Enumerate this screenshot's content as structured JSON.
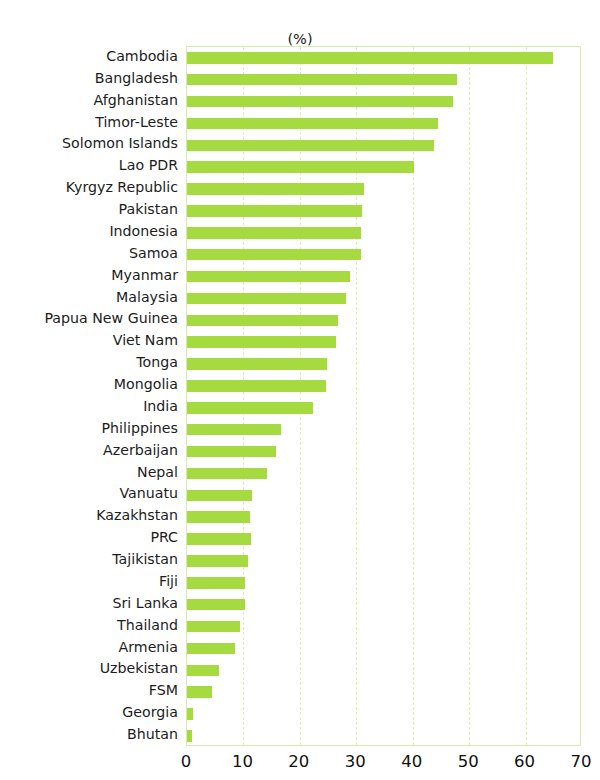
{
  "chart_data": {
    "type": "bar",
    "orientation": "horizontal",
    "title": "",
    "subtitle": "(%)",
    "xlabel": "",
    "ylabel": "",
    "xlim": [
      0,
      70
    ],
    "xticks": [
      "0",
      "10",
      "20",
      "30",
      "40",
      "50",
      "60",
      "70"
    ],
    "xtick_values": [
      0,
      10,
      20,
      30,
      40,
      50,
      60,
      70
    ],
    "grid": true,
    "grid_axis": "x",
    "legend": false,
    "bar_color": "#a5db41",
    "frame_color": "#d5ecb0",
    "categories": [
      "Cambodia",
      "Bangladesh",
      "Afghanistan",
      "Timor-Leste",
      "Solomon Islands",
      "Lao PDR",
      "Kyrgyz Republic",
      "Pakistan",
      "Indonesia",
      "Samoa",
      "Myanmar",
      "Malaysia",
      "Papua New Guinea",
      "Viet Nam",
      "Tonga",
      "Mongolia",
      "India",
      "Philippines",
      "Azerbaijan",
      "Nepal",
      "Vanuatu",
      "Kazakhstan",
      "PRC",
      "Tajikistan",
      "Fiji",
      "Sri Lanka",
      "Thailand",
      "Armenia",
      "Uzbekistan",
      "FSM",
      "Georgia",
      "Bhutan"
    ],
    "values": [
      64.8,
      47.8,
      47.2,
      44.5,
      43.8,
      40.2,
      31.3,
      31.0,
      30.9,
      30.8,
      28.9,
      28.2,
      26.8,
      26.4,
      24.8,
      24.6,
      22.3,
      16.7,
      15.8,
      14.2,
      11.5,
      11.2,
      11.3,
      10.8,
      10.3,
      10.2,
      9.4,
      8.5,
      5.7,
      4.4,
      1.0,
      0.8
    ]
  }
}
